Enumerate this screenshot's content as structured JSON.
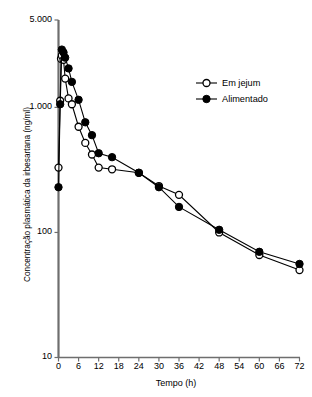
{
  "chart_data": {
    "type": "line",
    "title": "",
    "xlabel": "Tempo (h)",
    "ylabel": "Concentração plasmática da irbesartana (ng/ml)",
    "xlim": [
      0,
      72
    ],
    "ylim": [
      10,
      5000
    ],
    "yscale": "log",
    "grid": false,
    "legend_position": "top-right",
    "xticks": [
      0,
      6,
      12,
      18,
      24,
      30,
      36,
      42,
      48,
      54,
      60,
      66,
      72
    ],
    "xtick_labels": [
      "0",
      "6",
      "12",
      "18",
      "24",
      "30",
      "36",
      "42",
      "48",
      "54",
      "60",
      "66",
      "72"
    ],
    "yticks": [
      10,
      100,
      1000,
      5000
    ],
    "ytick_labels": [
      "10",
      "100",
      "1.000",
      "5.000"
    ],
    "series": [
      {
        "name": "Em jejum",
        "marker": "open-circle",
        "color": "#000000",
        "x": [
          0,
          0.5,
          0.75,
          1,
          1.5,
          2,
          3,
          4,
          6,
          8,
          10,
          12,
          16,
          24,
          30,
          36,
          48,
          60,
          72
        ],
        "values": [
          330,
          1130,
          2450,
          2600,
          2400,
          1700,
          1180,
          1060,
          700,
          520,
          420,
          330,
          320,
          300,
          235,
          200,
          100,
          66,
          50
        ]
      },
      {
        "name": "Alimentado",
        "marker": "filled-circle",
        "color": "#000000",
        "x": [
          0,
          0.5,
          1,
          1.5,
          2,
          3,
          4,
          6,
          8,
          10,
          12,
          16,
          24,
          30,
          36,
          48,
          60,
          72
        ],
        "values": [
          230,
          1060,
          2900,
          2750,
          2500,
          2050,
          1600,
          1150,
          760,
          600,
          430,
          400,
          300,
          230,
          160,
          105,
          70,
          56
        ]
      }
    ]
  },
  "legend": {
    "items": [
      {
        "label": "Em jejum",
        "marker": "open-circle"
      },
      {
        "label": "Alimentado",
        "marker": "filled-circle"
      }
    ]
  },
  "axes": {
    "x_title": "Tempo (h)",
    "y_title": "Concentração plasmática da irbesartana (ng/ml)"
  }
}
